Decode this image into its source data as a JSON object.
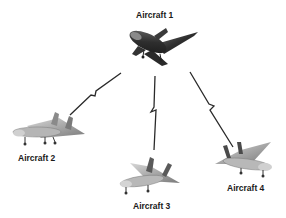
{
  "diagram": {
    "type": "network",
    "nodes": [
      {
        "id": "aircraft-1",
        "label": "Aircraft 1",
        "role": "hub"
      },
      {
        "id": "aircraft-2",
        "label": "Aircraft 2"
      },
      {
        "id": "aircraft-3",
        "label": "Aircraft 3"
      },
      {
        "id": "aircraft-4",
        "label": "Aircraft 4"
      }
    ],
    "links": [
      {
        "from": "aircraft-1",
        "to": "aircraft-2",
        "style": "lightning"
      },
      {
        "from": "aircraft-1",
        "to": "aircraft-3",
        "style": "lightning"
      },
      {
        "from": "aircraft-1",
        "to": "aircraft-4",
        "style": "lightning"
      }
    ]
  },
  "colors": {
    "background": "#ffffff",
    "link": "#2a2a2a",
    "label": "#1a1a1a",
    "hub_aircraft": "#3a3a3a",
    "other_aircraft": "#9a9a9a"
  }
}
